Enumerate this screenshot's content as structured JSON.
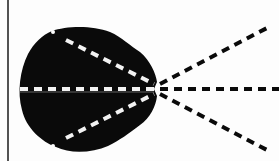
{
  "diagram": {
    "colors": {
      "background": "#fdfdfd",
      "blob": "#0a0a0a",
      "inner_dash": "#f2f2f2",
      "outer_dash": "#0a0a0a",
      "edge_line": "#1a1a1a"
    },
    "focal_point": {
      "x": 157,
      "y": 89
    },
    "rays": [
      {
        "name": "upper",
        "inner_start": {
          "x": 57,
          "y": 35
        },
        "outer_end": {
          "x": 267,
          "y": 27
        }
      },
      {
        "name": "middle",
        "inner_start": {
          "x": 20,
          "y": 89
        },
        "outer_end": {
          "x": 279,
          "y": 89
        }
      },
      {
        "name": "lower",
        "inner_start": {
          "x": 57,
          "y": 143
        },
        "outer_end": {
          "x": 267,
          "y": 150
        }
      }
    ]
  }
}
